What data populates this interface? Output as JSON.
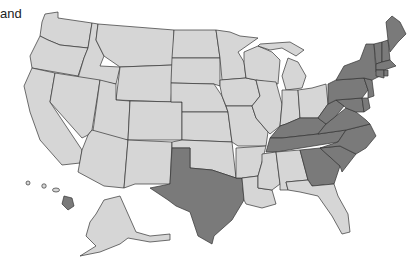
{
  "caption": "and",
  "legend": {
    "highlighted_color": "#7a7a7a",
    "default_color": "#d6d6d6",
    "border_color": "#333333"
  },
  "map": {
    "title": "United States",
    "highlighted_states": [
      "ME",
      "NH",
      "VT",
      "MA",
      "RI",
      "CT",
      "NY",
      "NJ",
      "PA",
      "DE",
      "MD",
      "WV",
      "VA",
      "KY",
      "TN",
      "NC",
      "SC",
      "GA",
      "TX",
      "HI"
    ],
    "default_states": [
      "WA",
      "OR",
      "CA",
      "ID",
      "NV",
      "MT",
      "WY",
      "UT",
      "AZ",
      "CO",
      "NM",
      "ND",
      "SD",
      "NE",
      "KS",
      "OK",
      "MN",
      "IA",
      "MO",
      "AR",
      "LA",
      "WI",
      "IL",
      "MI",
      "IN",
      "OH",
      "MS",
      "AL",
      "FL",
      "AK"
    ]
  }
}
